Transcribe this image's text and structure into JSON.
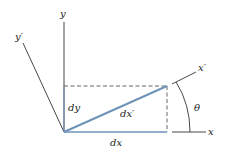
{
  "diagram": {
    "title": "",
    "labels": {
      "y": "y",
      "y_prime": "y′",
      "x": "x",
      "x_prime": "x′",
      "dy": "dy",
      "dx": "dx",
      "dx_prime": "dx′",
      "theta": "θ"
    },
    "colors": {
      "axis": "#333333",
      "segment": "#6f93b8",
      "dashed": "#555555"
    }
  }
}
